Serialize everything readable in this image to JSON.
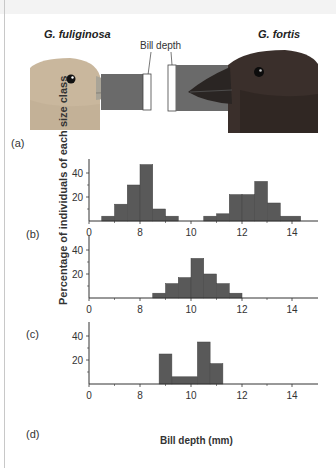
{
  "figure": {
    "species_left": "G. fuliginosa",
    "species_right": "G. fortis",
    "bill_depth_label": "Bill depth",
    "panel_labels": [
      "(a)",
      "(b)",
      "(c)",
      "(d)"
    ],
    "y_axis_label": "Percentage of individuals of each size class",
    "x_axis_label": "Bill depth (mm)",
    "colors": {
      "bar": "#595959",
      "axis": "#333333",
      "bird_left": "#c9b59b",
      "bird_right": "#3a2e2a",
      "bill_band": "#6a6a6a"
    }
  },
  "chart_data": [
    {
      "panel": "(b)",
      "type": "bar",
      "title": "",
      "xlabel": "",
      "ylabel": "Percentage of individuals of each size class",
      "x_ticks": [
        "0",
        "8",
        "10",
        "12",
        "14"
      ],
      "y_ticks": [
        "20",
        "40"
      ],
      "ylim": [
        0,
        50
      ],
      "grid": false,
      "bins": [
        {
          "from": 6.5,
          "to": 7.0,
          "value": 4
        },
        {
          "from": 7.0,
          "to": 7.5,
          "value": 14
        },
        {
          "from": 7.5,
          "to": 8.0,
          "value": 30
        },
        {
          "from": 8.0,
          "to": 8.5,
          "value": 47
        },
        {
          "from": 8.5,
          "to": 9.0,
          "value": 10
        },
        {
          "from": 9.0,
          "to": 9.5,
          "value": 4
        },
        {
          "from": 10.5,
          "to": 11.0,
          "value": 4
        },
        {
          "from": 11.0,
          "to": 11.5,
          "value": 6
        },
        {
          "from": 11.5,
          "to": 12.0,
          "value": 22
        },
        {
          "from": 12.0,
          "to": 12.5,
          "value": 22
        },
        {
          "from": 12.5,
          "to": 13.0,
          "value": 33
        },
        {
          "from": 13.0,
          "to": 13.5,
          "value": 15
        },
        {
          "from": 13.5,
          "to": 14.3,
          "value": 4
        }
      ]
    },
    {
      "panel": "(c)",
      "type": "bar",
      "title": "",
      "xlabel": "",
      "ylabel": "Percentage of individuals of each size class",
      "x_ticks": [
        "0",
        "8",
        "10",
        "12",
        "14"
      ],
      "y_ticks": [
        "20",
        "40"
      ],
      "ylim": [
        0,
        50
      ],
      "grid": false,
      "bins": [
        {
          "from": 8.5,
          "to": 9.0,
          "value": 4
        },
        {
          "from": 9.0,
          "to": 9.5,
          "value": 12
        },
        {
          "from": 9.5,
          "to": 10.0,
          "value": 17
        },
        {
          "from": 10.0,
          "to": 10.5,
          "value": 33
        },
        {
          "from": 10.5,
          "to": 11.0,
          "value": 20
        },
        {
          "from": 11.0,
          "to": 11.5,
          "value": 12
        },
        {
          "from": 11.5,
          "to": 12.0,
          "value": 4
        }
      ]
    },
    {
      "panel": "(d)",
      "type": "bar",
      "title": "",
      "xlabel": "Bill depth (mm)",
      "ylabel": "Percentage of individuals of each size class",
      "x_ticks": [
        "0",
        "8",
        "10",
        "12",
        "14"
      ],
      "y_ticks": [
        "20",
        "40"
      ],
      "ylim": [
        0,
        50
      ],
      "grid": false,
      "bins": [
        {
          "from": 8.75,
          "to": 9.25,
          "value": 25
        },
        {
          "from": 9.25,
          "to": 10.25,
          "value": 6
        },
        {
          "from": 10.25,
          "to": 10.75,
          "value": 35
        },
        {
          "from": 10.75,
          "to": 11.25,
          "value": 17
        }
      ]
    }
  ]
}
